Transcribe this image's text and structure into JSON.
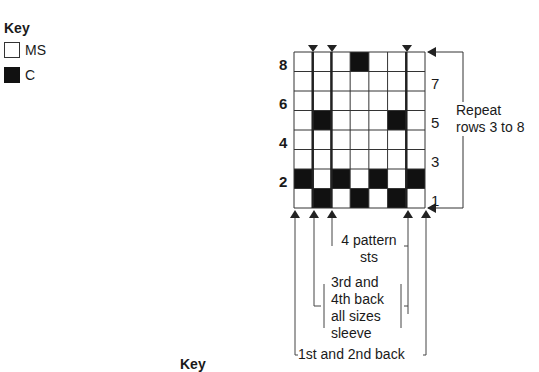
{
  "key": {
    "title": "Key",
    "items": [
      {
        "label": "MS",
        "swatch": "white"
      },
      {
        "label": "C",
        "swatch": "black"
      }
    ]
  },
  "chart": {
    "columns": 7,
    "rows": 8,
    "cells_c": {
      "8": [
        4
      ],
      "7": [],
      "6": [],
      "5": [
        2,
        6
      ],
      "4": [],
      "3": [],
      "2": [
        1,
        3,
        5,
        7
      ],
      "1": [
        2,
        4,
        6
      ]
    },
    "thick_lines_after_columns": [
      1,
      2,
      6
    ],
    "left_row_labels": [
      "8",
      "6",
      "4",
      "2"
    ],
    "right_row_labels": [
      "7",
      "5",
      "3",
      "1"
    ]
  },
  "repeat_note": {
    "line1": "Repeat",
    "line2": "rows 3 to 8"
  },
  "brackets": {
    "pattern": {
      "line1": "4 pattern",
      "line2": "sts"
    },
    "third_fourth": {
      "line1": "3rd and",
      "line2": "4th back",
      "line3": "all sizes",
      "line4": "sleeve"
    },
    "first_second": {
      "label": "1st and 2nd back"
    }
  },
  "footer_key": "Key",
  "colors": {
    "c": "#111111",
    "ms": "#ffffff",
    "line": "#333333"
  }
}
